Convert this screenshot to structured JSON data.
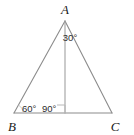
{
  "figure": {
    "kind": "geometry-diagram",
    "shape": "triangle",
    "background_color": "#ffffff",
    "stroke_color": "#8c8c8c",
    "marker_color": "#b0b0b0",
    "text_color": "#1a1a1a",
    "vertices": [
      {
        "name": "A",
        "label": "A",
        "x": 65,
        "y": 21,
        "label_x": 65,
        "label_y": 13
      },
      {
        "name": "B",
        "label": "B",
        "x": 14,
        "y": 113,
        "label_x": 13,
        "label_y": 130
      },
      {
        "name": "C",
        "label": "C",
        "x": 112,
        "y": 113,
        "label_x": 113,
        "label_y": 130
      }
    ],
    "sides": [
      {
        "name": "AB",
        "from": "A",
        "to": "B"
      },
      {
        "name": "AC",
        "from": "A",
        "to": "C"
      },
      {
        "name": "BC",
        "from": "B",
        "to": "C"
      }
    ],
    "altitude": {
      "name": "altitude-A-to-BC",
      "from_x": 65,
      "from_y": 21,
      "to_x": 65,
      "to_y": 113
    },
    "right_angle_marker": {
      "name": "right-angle-square",
      "x": 59,
      "y": 105,
      "size": 8
    },
    "angle_labels": [
      {
        "name": "angle-apex",
        "text": "30°",
        "x": 69,
        "y": 40,
        "anchor": "middle"
      },
      {
        "name": "angle-b",
        "text": "60°",
        "x": 22,
        "y": 112,
        "anchor": "start"
      },
      {
        "name": "angle-altitude-foot",
        "text": "90°",
        "x": 42,
        "y": 112,
        "anchor": "start"
      }
    ],
    "angle_arc": {
      "name": "angle-arc-b",
      "center_x": 14,
      "center_y": 113,
      "radius": 9
    }
  }
}
